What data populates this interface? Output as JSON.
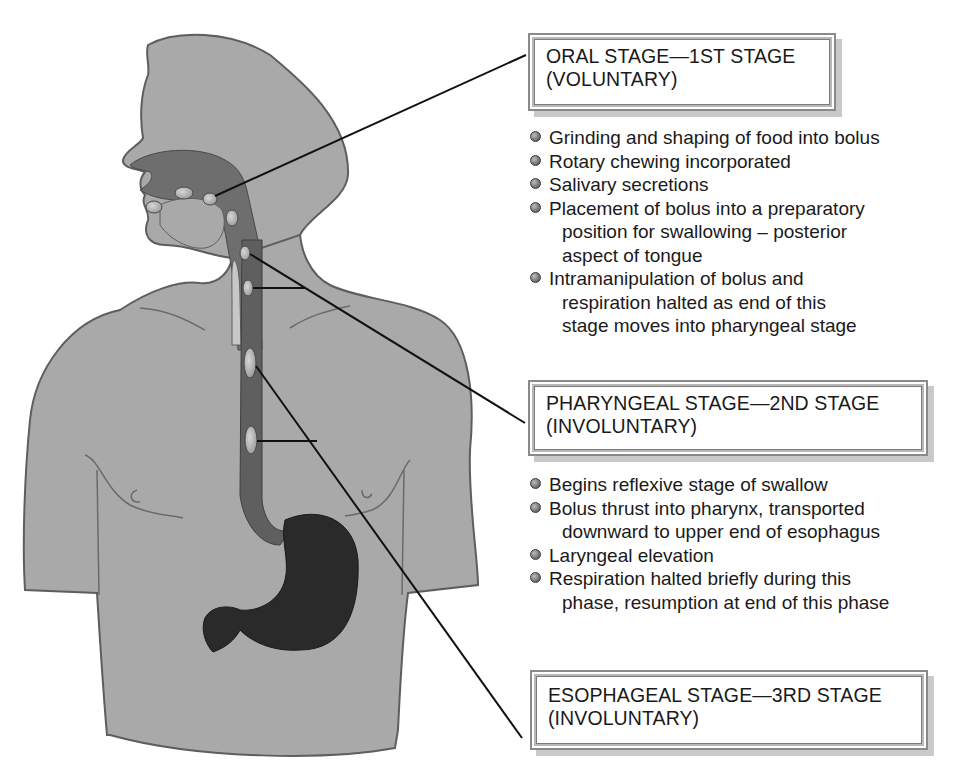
{
  "figure": {
    "colors": {
      "body_fill": "#a9a9a9",
      "body_outline": "#5e5e5e",
      "tract_fill": "#6e6e6e",
      "stomach_fill": "#2a2a2a",
      "bolus_fill": "#b5b5b5",
      "leader_line": "#111111",
      "box_border": "#8a8a8a",
      "box_shadow": "#c9c9c9",
      "bullet_color": "#7a7a7a"
    }
  },
  "stages": [
    {
      "id": "oral",
      "title": "ORAL STAGE—1ST STAGE",
      "subtitle": "(VOLUNTARY)",
      "bullets": [
        {
          "lines": [
            "Grinding and shaping of food into bolus"
          ]
        },
        {
          "lines": [
            "Rotary chewing incorporated"
          ]
        },
        {
          "lines": [
            "Salivary secretions"
          ]
        },
        {
          "lines": [
            "Placement of bolus into a preparatory",
            "position for swallowing – posterior",
            "aspect of tongue"
          ]
        },
        {
          "lines": [
            "Intramanipulation of bolus and",
            "respiration halted as end of this",
            "stage moves into pharyngeal stage"
          ]
        }
      ]
    },
    {
      "id": "pharyngeal",
      "title": "PHARYNGEAL STAGE—2ND STAGE",
      "subtitle": "(INVOLUNTARY)",
      "bullets": [
        {
          "lines": [
            "Begins reflexive stage of swallow"
          ]
        },
        {
          "lines": [
            "Bolus thrust into pharynx, transported",
            "downward to upper end of esophagus"
          ]
        },
        {
          "lines": [
            "Laryngeal elevation"
          ]
        },
        {
          "lines": [
            "Respiration halted briefly during this",
            "phase, resumption at end of this phase"
          ]
        }
      ]
    },
    {
      "id": "esophageal",
      "title": "ESOPHAGEAL STAGE—3RD STAGE",
      "subtitle": "(INVOLUNTARY)",
      "bullets": []
    }
  ],
  "illustration": {
    "subject": "human-torso-with-digestive-tract",
    "features": [
      "head-profile",
      "oral-cavity",
      "pharynx",
      "esophagus",
      "stomach",
      "bolus-markers"
    ]
  }
}
